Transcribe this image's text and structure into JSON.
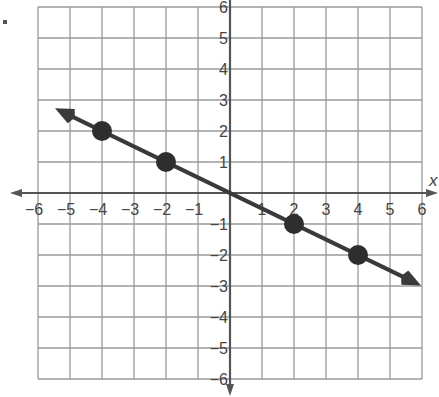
{
  "chart_data": {
    "type": "line",
    "title": "",
    "xlabel": "x",
    "ylabel": "",
    "xlim": [
      -6,
      6
    ],
    "ylim": [
      -6,
      6
    ],
    "grid": true,
    "x_ticks": [
      -6,
      -5,
      -4,
      -3,
      -2,
      -1,
      1,
      2,
      3,
      4,
      5,
      6
    ],
    "y_ticks": [
      6,
      5,
      4,
      3,
      2,
      1,
      -1,
      -2,
      -3,
      -4,
      -5,
      -6
    ],
    "x_tick_labels": [
      "−6",
      "−5",
      "−4",
      "−3",
      "−2",
      "−1",
      "1",
      "2",
      "3",
      "4",
      "5",
      "6"
    ],
    "y_tick_labels": [
      "6",
      "5",
      "4",
      "3",
      "2",
      "1",
      "−1",
      "−2",
      "−3",
      "−4",
      "−5",
      "−6"
    ],
    "series": [
      {
        "name": "line",
        "equation": "y = -x/2",
        "points": [
          {
            "x": -4,
            "y": 2
          },
          {
            "x": -2,
            "y": 1
          },
          {
            "x": 2,
            "y": -1
          },
          {
            "x": 4,
            "y": -2
          }
        ],
        "arrow_start": {
          "x": -5.3,
          "y": 2.65
        },
        "arrow_end": {
          "x": 5.8,
          "y": -2.9
        }
      }
    ],
    "colors": {
      "grid": "#9a9a9a",
      "axis": "#555555",
      "line": "#3a3a3a",
      "point": "#2e2e2e"
    }
  }
}
